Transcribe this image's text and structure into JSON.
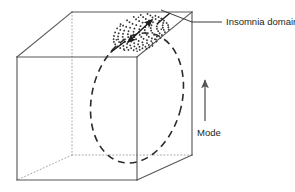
{
  "figure": {
    "background_color": "#ffffff",
    "line_color": "#4d4d4d",
    "hidden_line_color": "#9a9a9a",
    "accent_color": "#231f20",
    "stipple_color": "#333333"
  },
  "labels": {
    "insomnia_domain": "Insomnia domain",
    "mode": "Mode"
  },
  "annotations": {
    "leader_line_name": "insomnia-domain-leader-line",
    "mode_arrow_name": "mode-direction-arrow",
    "bidirectional_arrow_name": "insomnia-domain-extent-arrow"
  },
  "geometry": {
    "cube": {
      "front_face": [
        [
          17,
          57
        ],
        [
          137,
          57
        ],
        [
          137,
          180
        ],
        [
          17,
          180
        ]
      ],
      "back_face": [
        [
          72,
          12
        ],
        [
          192,
          12
        ],
        [
          192,
          155
        ],
        [
          72,
          155
        ]
      ],
      "visible_edges": [
        [
          [
            17,
            57
          ],
          [
            137,
            57
          ]
        ],
        [
          [
            17,
            57
          ],
          [
            17,
            180
          ]
        ],
        [
          [
            17,
            180
          ],
          [
            137,
            180
          ]
        ],
        [
          [
            137,
            180
          ],
          [
            137,
            57
          ]
        ],
        [
          [
            17,
            57
          ],
          [
            72,
            12
          ]
        ],
        [
          [
            72,
            12
          ],
          [
            192,
            12
          ]
        ],
        [
          [
            192,
            12
          ],
          [
            192,
            155
          ]
        ],
        [
          [
            192,
            155
          ],
          [
            137,
            180
          ]
        ],
        [
          [
            137,
            57
          ],
          [
            192,
            12
          ]
        ]
      ],
      "hidden_edges": [
        [
          [
            72,
            12
          ],
          [
            72,
            155
          ]
        ],
        [
          [
            72,
            155
          ],
          [
            192,
            155
          ]
        ],
        [
          [
            72,
            155
          ],
          [
            17,
            180
          ]
        ]
      ]
    },
    "dashed_ellipse": {
      "cx": 137,
      "cy": 98,
      "rx": 45,
      "ry": 66,
      "rotation_deg": 14
    },
    "stipple_ellipse": {
      "cx": 140,
      "cy": 30,
      "rx": 27,
      "ry": 18,
      "rotation_deg": -22,
      "dot_count": 150
    },
    "mode_arrow": {
      "x": 205,
      "y_top": 82,
      "y_bottom": 120
    },
    "leader": {
      "from": [
        288,
        22
      ],
      "to": [
        163,
        22
      ],
      "elbow": [
        193,
        12
      ]
    }
  }
}
